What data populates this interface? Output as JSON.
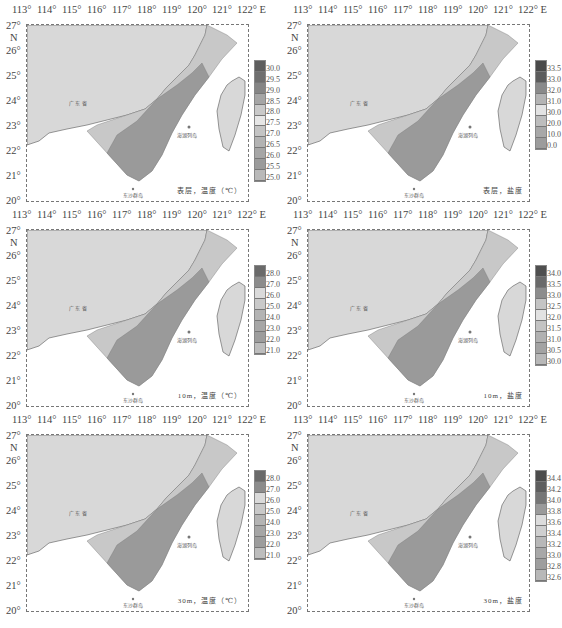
{
  "figure": {
    "layout": "3 rows x 2 columns",
    "x_axis_ticks": [
      "113°",
      "114°",
      "115°",
      "116°",
      "117°",
      "118°",
      "119°",
      "120°",
      "121°",
      "122°"
    ],
    "x_axis_suffix": "E",
    "y_axis_ticks": [
      "27°",
      "26°",
      "25°",
      "24°",
      "23°",
      "22°",
      "21°",
      "20°"
    ],
    "y_axis_suffix": "N",
    "map_labels": {
      "province_guangdong": "广 东 省",
      "province_fujian": "福 建 省",
      "penghu": "澎湖列岛",
      "dongsha": "东沙群岛",
      "taipei": "台北",
      "taiwan": "台 湾"
    }
  },
  "panels": [
    {
      "id": "surface-temperature",
      "caption": "表层，温度（℃）",
      "legend": {
        "labels": [
          "30.0",
          "29.5",
          "29.0",
          "28.5",
          "28.0",
          "27.5",
          "27.0",
          "26.5",
          "26.0",
          "25.5",
          "25.0"
        ],
        "colors": [
          "#5e5e5e",
          "#6f6f6f",
          "#858585",
          "#a5a5a5",
          "#c9c9c9",
          "#e6e6e6",
          "#c4c4c4",
          "#b3b3b3",
          "#a6a6a6",
          "#9b9b9b",
          "#b9b9b9"
        ]
      }
    },
    {
      "id": "surface-salinity",
      "caption": "表层，盐度",
      "legend": {
        "labels": [
          "33.5",
          "33.0",
          "32.0",
          "31.0",
          "30.0",
          "20.0",
          "10.0",
          "0.0"
        ],
        "colors": [
          "#4a4a4a",
          "#5c5c5c",
          "#8a8a8a",
          "#b4b4b4",
          "#e3e3e3",
          "#bdbdbd",
          "#a8a8a8",
          "#9c9c9c"
        ]
      }
    },
    {
      "id": "10m-temperature",
      "caption": "10m，温度（℃）",
      "legend": {
        "labels": [
          "28.0",
          "27.0",
          "26.0",
          "25.0",
          "24.0",
          "23.0",
          "22.0",
          "21.0"
        ],
        "colors": [
          "#6a6a6a",
          "#8c8c8c",
          "#dadada",
          "#c9c9c9",
          "#b4b4b4",
          "#a6a6a6",
          "#9d9d9d",
          "#bdbdbd"
        ]
      }
    },
    {
      "id": "10m-salinity",
      "caption": "10m，盐度",
      "legend": {
        "labels": [
          "34.0",
          "33.5",
          "33.0",
          "32.5",
          "32.0",
          "31.5",
          "31.0",
          "30.5",
          "30.0"
        ],
        "colors": [
          "#4f4f4f",
          "#6a6a6a",
          "#8d8d8d",
          "#c4c4c4",
          "#e2e2e2",
          "#c3c3c3",
          "#b1b1b1",
          "#a3a3a3",
          "#b8b8b8"
        ]
      }
    },
    {
      "id": "30m-temperature",
      "caption": "30m，温度（℃）",
      "legend": {
        "labels": [
          "28.0",
          "27.0",
          "26.0",
          "25.0",
          "24.0",
          "23.0",
          "22.0",
          "21.0"
        ],
        "colors": [
          "#6a6a6a",
          "#8c8c8c",
          "#dadada",
          "#c9c9c9",
          "#b4b4b4",
          "#a6a6a6",
          "#9d9d9d",
          "#bdbdbd"
        ]
      }
    },
    {
      "id": "30m-salinity",
      "caption": "30m，盐度",
      "legend": {
        "labels": [
          "34.4",
          "34.2",
          "34.0",
          "33.8",
          "33.6",
          "33.4",
          "33.2",
          "33.0",
          "32.8",
          "32.6"
        ],
        "colors": [
          "#4c4c4c",
          "#5e5e5e",
          "#767676",
          "#9a9a9a",
          "#dcdcdc",
          "#cfcfcf",
          "#b8b8b8",
          "#a8a8a8",
          "#9e9e9e",
          "#b8b8b8"
        ]
      }
    }
  ],
  "colors": {
    "land": "#d8d8d8",
    "sea_background": "#ffffff",
    "frame": "#777777"
  }
}
